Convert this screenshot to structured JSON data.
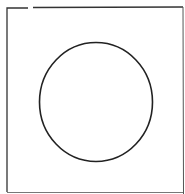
{
  "diagram": {
    "shapes": [
      {
        "type": "frame",
        "description": "square outline with small gap in top edge near left corner"
      },
      {
        "type": "circle",
        "description": "circle centered inside the square"
      }
    ],
    "colors": {
      "background": "#ffffff",
      "stroke": "#222222",
      "frame_stroke": "#333333"
    }
  }
}
